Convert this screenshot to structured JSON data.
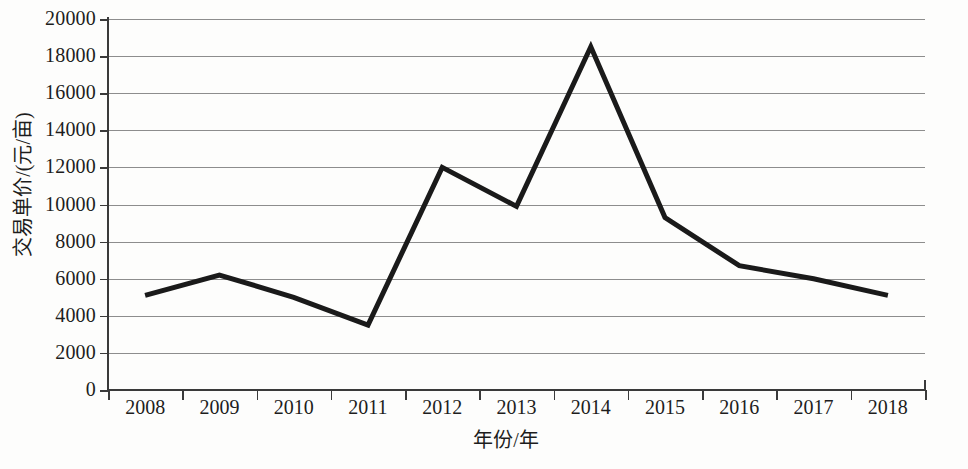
{
  "chart_data": {
    "type": "line",
    "title": "",
    "subtitle": "",
    "xlabel": "年份/年",
    "ylabel": "交易单价/(元/亩)",
    "categories": [
      "2008",
      "2009",
      "2010",
      "2011",
      "2012",
      "2013",
      "2014",
      "2015",
      "2016",
      "2017",
      "2018"
    ],
    "x": [
      2008,
      2009,
      2010,
      2011,
      2012,
      2013,
      2014,
      2015,
      2016,
      2017,
      2018
    ],
    "series": [
      {
        "name": "交易单价",
        "values": [
          5100,
          6200,
          5000,
          3500,
          12000,
          9900,
          18500,
          9300,
          6700,
          6000,
          5100
        ]
      }
    ],
    "ylim": [
      0,
      20000
    ],
    "ytick_labels": [
      "0",
      "2000",
      "4000",
      "6000",
      "8000",
      "10000",
      "12000",
      "14000",
      "16000",
      "18000",
      "20000"
    ],
    "yticks": [
      0,
      2000,
      4000,
      6000,
      8000,
      10000,
      12000,
      14000,
      16000,
      18000,
      20000
    ],
    "grid": true,
    "grid_axis": "y",
    "legend": false,
    "legend_position": "none",
    "annotations": [],
    "colors": {
      "line": "#1a1a1a",
      "grid": "#8d8d8d",
      "axis": "#3a3a3a",
      "background": "#fdfdfc",
      "text": "#1d1d1d"
    },
    "line_width": 5
  }
}
